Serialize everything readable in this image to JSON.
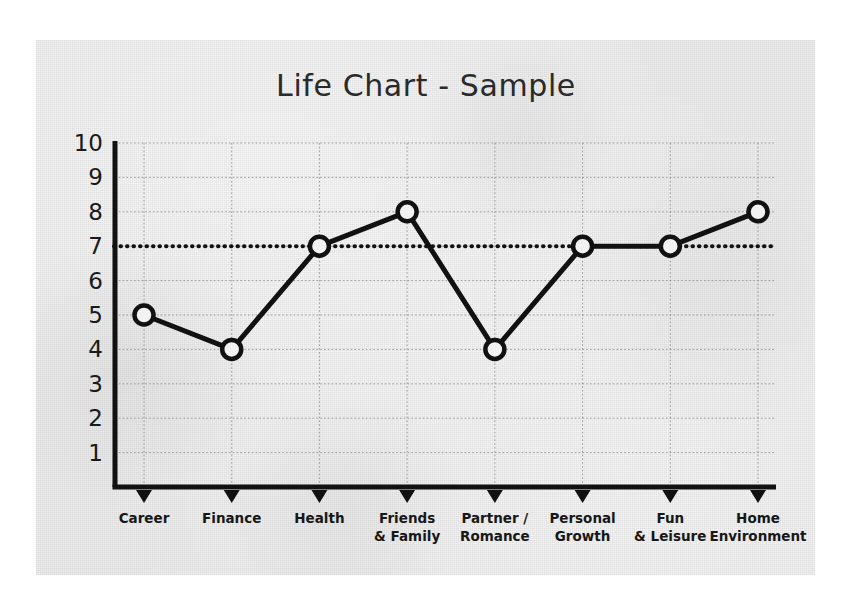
{
  "chart_data": {
    "type": "line",
    "title": "Life Chart - Sample",
    "xlabel": "",
    "ylabel": "",
    "categories": [
      "Career",
      "Finance",
      "Health",
      "Friends\n& Family",
      "Partner /\nRomance",
      "Personal\nGrowth",
      "Fun\n& Leisure",
      "Home\nEnvironment"
    ],
    "values": [
      5,
      4,
      7,
      8,
      4,
      7,
      7,
      8
    ],
    "series": [
      {
        "name": "Life Chart - Sample",
        "values": [
          5,
          4,
          7,
          8,
          4,
          7,
          7,
          8
        ]
      }
    ],
    "ylim": [
      0,
      10
    ],
    "ytick_labels": [
      "10",
      "9",
      "8",
      "7",
      "6",
      "5",
      "4",
      "3",
      "2",
      "1"
    ],
    "ytick_values": [
      10,
      9,
      8,
      7,
      6,
      5,
      4,
      3,
      2,
      1
    ],
    "grid": true,
    "legend": "none",
    "annotations": [
      {
        "name": "target-reference-line",
        "type": "horizontal-dotted-line",
        "value": 7,
        "label": ""
      }
    ],
    "marker": "open-circle",
    "colors": {
      "line": "#111111",
      "marker_fill": "#f2f2f2",
      "marker_stroke": "#111111",
      "axis": "#111111",
      "grid": "#8c8c8c",
      "reference_line": "#111111",
      "title_text": "#2a2a2a",
      "tick_text": "#1a1a1a",
      "panel_background": "#ebebeb",
      "page_background": "#ffffff"
    }
  }
}
